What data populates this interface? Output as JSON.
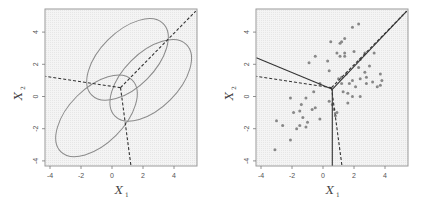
{
  "chart_data": [
    {
      "type": "scatter",
      "panel": "left",
      "title": "",
      "xlabel": "X1",
      "ylabel": "X2",
      "xlim": [
        -4.3,
        5.4
      ],
      "ylim": [
        -4.5,
        5.3
      ],
      "xticks": [
        -4,
        -2,
        0,
        2,
        4
      ],
      "yticks": [
        -4,
        -2,
        0,
        2,
        4
      ],
      "grid": false,
      "ellipses": [
        {
          "name": "class-1",
          "cx": 1.0,
          "cy": 2.3,
          "rx": 3.2,
          "ry": 1.75,
          "angle_deg": 45,
          "color": "#8a8a8a"
        },
        {
          "name": "class-2",
          "cx": -1.0,
          "cy": -1.2,
          "rx": 3.2,
          "ry": 1.75,
          "angle_deg": 45,
          "color": "#8a8a8a"
        },
        {
          "name": "class-3",
          "cx": 2.5,
          "cy": 1.0,
          "rx": 3.2,
          "ry": 1.75,
          "angle_deg": 45,
          "color": "#8a8a8a"
        }
      ],
      "bayes_boundaries_dashed": [
        {
          "from": [
            0.55,
            0.55
          ],
          "to": [
            -4.3,
            1.25
          ]
        },
        {
          "from": [
            0.55,
            0.55
          ],
          "to": [
            5.4,
            5.3
          ]
        },
        {
          "from": [
            0.55,
            0.55
          ],
          "to": [
            1.25,
            -4.5
          ]
        }
      ]
    },
    {
      "type": "scatter",
      "panel": "right",
      "title": "",
      "xlabel": "X1",
      "ylabel": "X2",
      "xlim": [
        -4.3,
        5.4
      ],
      "ylim": [
        -4.5,
        5.3
      ],
      "xticks": [
        -4,
        -2,
        0,
        2,
        4
      ],
      "yticks": [
        -4,
        -2,
        0,
        2,
        4
      ],
      "grid": false,
      "point_color": "#888888",
      "points": [
        [
          -3.1,
          -3.3
        ],
        [
          -2.1,
          -2.7
        ],
        [
          -3.0,
          -1.5
        ],
        [
          -2.6,
          -1.8
        ],
        [
          -1.9,
          -1.0
        ],
        [
          -2.1,
          -0.1
        ],
        [
          -1.7,
          -2.0
        ],
        [
          -1.5,
          -1.8
        ],
        [
          -1.3,
          -1.3
        ],
        [
          -1.4,
          -0.5
        ],
        [
          -1.1,
          -1.9
        ],
        [
          -1.0,
          -1.6
        ],
        [
          -1.1,
          -0.1
        ],
        [
          -0.7,
          -0.8
        ],
        [
          -0.5,
          -0.7
        ],
        [
          -0.2,
          -1.4
        ],
        [
          -1.5,
          -0.9
        ],
        [
          -0.6,
          0.3
        ],
        [
          -0.2,
          0.8
        ],
        [
          0.4,
          -0.3
        ],
        [
          0.7,
          -0.8
        ],
        [
          0.8,
          -1.2
        ],
        [
          0.9,
          -1.0
        ],
        [
          0.6,
          -0.5
        ],
        [
          -0.9,
          2.1
        ],
        [
          -0.5,
          2.5
        ],
        [
          0.3,
          2.2
        ],
        [
          0.4,
          1.6
        ],
        [
          0.5,
          3.4
        ],
        [
          0.9,
          2.7
        ],
        [
          1.1,
          2.5
        ],
        [
          1.1,
          3.3
        ],
        [
          1.2,
          3.4
        ],
        [
          1.4,
          3.6
        ],
        [
          1.4,
          2.7
        ],
        [
          1.4,
          2.5
        ],
        [
          1.0,
          1.1
        ],
        [
          1.2,
          1.2
        ],
        [
          1.5,
          1.4
        ],
        [
          1.9,
          4.3
        ],
        [
          2.3,
          4.5
        ],
        [
          2.0,
          2.8
        ],
        [
          2.4,
          2.3
        ],
        [
          2.7,
          2.7
        ],
        [
          3.3,
          2.7
        ],
        [
          1.9,
          1.0
        ],
        [
          2.3,
          1.8
        ],
        [
          2.1,
          0.6
        ],
        [
          2.4,
          1.1
        ],
        [
          2.7,
          1.5
        ],
        [
          2.8,
          0.8
        ],
        [
          2.8,
          1.2
        ],
        [
          3.0,
          1.9
        ],
        [
          3.2,
          0.9
        ],
        [
          3.5,
          0.6
        ],
        [
          3.7,
          1.4
        ],
        [
          3.7,
          0.7
        ],
        [
          3.8,
          1.0
        ],
        [
          1.3,
          0.3
        ],
        [
          1.6,
          0.2
        ],
        [
          1.9,
          0.0
        ],
        [
          2.4,
          0.0
        ],
        [
          1.6,
          -0.4
        ],
        [
          1.2,
          0.8
        ],
        [
          1.7,
          0.8
        ]
      ],
      "lda_boundaries_solid": [
        {
          "from": [
            0.6,
            0.45
          ],
          "to": [
            -4.3,
            2.4
          ]
        },
        {
          "from": [
            0.6,
            0.45
          ],
          "to": [
            5.4,
            5.3
          ]
        },
        {
          "from": [
            0.6,
            0.45
          ],
          "to": [
            0.6,
            -4.5
          ]
        }
      ],
      "bayes_boundaries_dashed": [
        {
          "from": [
            0.55,
            0.55
          ],
          "to": [
            -4.3,
            1.25
          ]
        },
        {
          "from": [
            0.55,
            0.55
          ],
          "to": [
            5.4,
            5.3
          ]
        },
        {
          "from": [
            0.55,
            0.55
          ],
          "to": [
            1.25,
            -4.5
          ]
        }
      ]
    }
  ],
  "labels": {
    "x_main": "X",
    "x_sub": "1",
    "y_main": "X",
    "y_sub": "2"
  },
  "colors": {
    "plot_bg": "#f4f4f4",
    "grid_dot": "#e6e6e6",
    "frame": "#9a9a9a",
    "ellipse": "#8a8a8a",
    "line": "#333333",
    "point": "#888888"
  }
}
